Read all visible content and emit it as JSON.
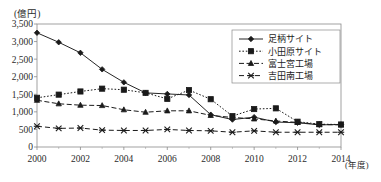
{
  "chart_data": {
    "type": "line",
    "title": "",
    "xlabel": "(年度)",
    "ylabel": "(億円)",
    "x": [
      2000,
      2001,
      2002,
      2003,
      2004,
      2005,
      2006,
      2007,
      2008,
      2009,
      2010,
      2011,
      2012,
      2013,
      2014
    ],
    "xtick_labels": [
      "2000",
      "2002",
      "2004",
      "2006",
      "2008",
      "2010",
      "2012",
      "2014"
    ],
    "xticks": [
      2000,
      2002,
      2004,
      2006,
      2008,
      2010,
      2012,
      2014
    ],
    "ytick_labels": [
      "0",
      "500",
      "1,000",
      "1,500",
      "2,000",
      "2,500",
      "3,000",
      "3,500"
    ],
    "yticks": [
      0,
      500,
      1000,
      1500,
      2000,
      2500,
      3000,
      3500
    ],
    "ylim": [
      0,
      3500
    ],
    "xlim": [
      2000,
      2014
    ],
    "grid": false,
    "legend_position": "top-right",
    "series": [
      {
        "name": "足柄サイト",
        "marker": "diamond",
        "dash": "solid",
        "color": "#1a1a1a",
        "values": [
          3250,
          2980,
          2680,
          2210,
          1840,
          1540,
          1510,
          1480,
          920,
          780,
          850,
          710,
          690,
          630,
          640
        ]
      },
      {
        "name": "小田原サイト",
        "marker": "square",
        "dash": "dotted",
        "color": "#1a1a1a",
        "values": [
          1400,
          1490,
          1580,
          1660,
          1630,
          1540,
          1370,
          1620,
          1360,
          880,
          1080,
          1100,
          720,
          650,
          640
        ]
      },
      {
        "name": "富士宮工場",
        "marker": "triangle",
        "dash": "dashdot",
        "color": "#1a1a1a",
        "values": [
          1330,
          1230,
          1190,
          1180,
          1060,
          990,
          1030,
          1030,
          900,
          840,
          800,
          740,
          700,
          640,
          630
        ]
      },
      {
        "name": "吉田南工場",
        "marker": "cross",
        "dash": "dashed",
        "color": "#1a1a1a",
        "values": [
          590,
          530,
          540,
          480,
          470,
          470,
          500,
          470,
          460,
          420,
          460,
          420,
          420,
          420,
          420
        ]
      }
    ]
  }
}
